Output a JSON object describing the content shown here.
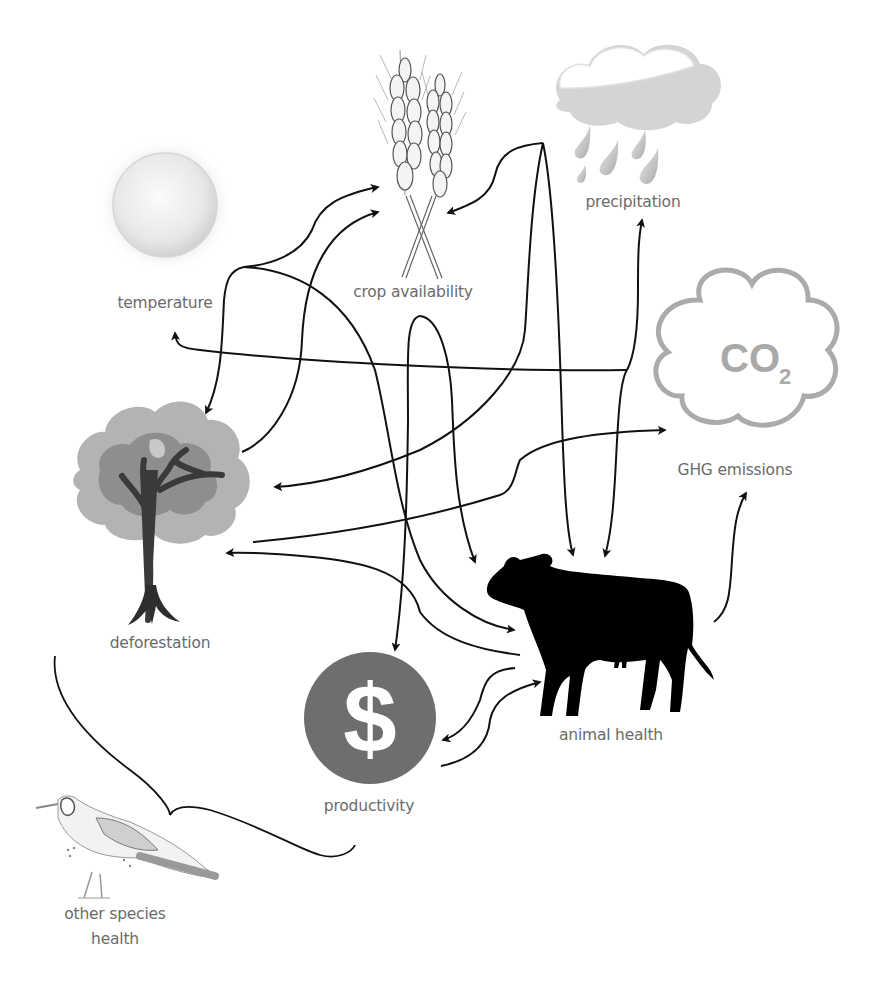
{
  "diagram": {
    "type": "causal-loop",
    "nodes": [
      {
        "id": "temperature",
        "label": "temperature",
        "icon": "sun-icon"
      },
      {
        "id": "crop",
        "label": "crop availability",
        "icon": "wheat-icon"
      },
      {
        "id": "precipitation",
        "label": "precipitation",
        "icon": "rain-cloud-icon"
      },
      {
        "id": "ghg",
        "label": "GHG emissions",
        "icon": "co2-cloud-icon",
        "icon_text": "CO",
        "icon_subscript": "2"
      },
      {
        "id": "deforestation",
        "label": "deforestation",
        "icon": "tree-icon"
      },
      {
        "id": "animal",
        "label": "animal health",
        "icon": "cow-icon"
      },
      {
        "id": "productivity",
        "label": "productivity",
        "icon": "dollar-coin-icon",
        "icon_text": "$"
      },
      {
        "id": "other_species",
        "label_line1": "other species",
        "label_line2": "health",
        "icon": "bird-icon"
      }
    ],
    "edges": [
      {
        "from": "temperature",
        "to": "crop"
      },
      {
        "from": "temperature",
        "to": "deforestation"
      },
      {
        "from": "temperature",
        "to": "animal"
      },
      {
        "from": "deforestation",
        "to": "crop"
      },
      {
        "from": "deforestation",
        "to": "ghg"
      },
      {
        "from": "precipitation",
        "to": "crop"
      },
      {
        "from": "precipitation",
        "to": "animal"
      },
      {
        "from": "precipitation",
        "to": "deforestation"
      },
      {
        "from": "crop",
        "to": "animal"
      },
      {
        "from": "crop",
        "to": "productivity"
      },
      {
        "from": "ghg",
        "to": "temperature"
      },
      {
        "from": "ghg",
        "to": "precipitation"
      },
      {
        "from": "ghg",
        "to": "animal"
      },
      {
        "from": "animal",
        "to": "ghg"
      },
      {
        "from": "animal",
        "to": "deforestation"
      },
      {
        "from": "animal",
        "to": "productivity"
      },
      {
        "from": "productivity",
        "to": "animal"
      }
    ],
    "brace": {
      "groups": [
        "deforestation",
        "productivity"
      ],
      "points_to": "other_species"
    },
    "colors": {
      "label": "#6b6b6b",
      "arrow": "#111111",
      "sun": "#e2e2e2",
      "cloud": "#cfcfcf",
      "co2_outline": "#a9a9a9",
      "tree_foliage_light": "#b3b3b3",
      "tree_foliage_dark": "#8e8e8e",
      "tree_trunk": "#3a3a3a",
      "cow": "#000000",
      "coin": "#6e6e6e"
    }
  }
}
